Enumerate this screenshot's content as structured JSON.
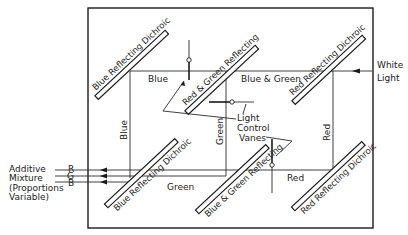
{
  "diagram": {
    "type": "optical-schematic",
    "input": {
      "label_line1": "White",
      "label_line2": "Light"
    },
    "mirrors": [
      {
        "id": "m1",
        "label": "Blue Reflecting Dichroic"
      },
      {
        "id": "m2",
        "label": "Red & Green Reflecting"
      },
      {
        "id": "m3",
        "label": "Red Reflecting Dichroic"
      },
      {
        "id": "m4",
        "label": "Blue Reflecting Dichroic"
      },
      {
        "id": "m5",
        "label": "Blue & Green Reflecting"
      },
      {
        "id": "m6",
        "label": "Red Reflecting Dichroic"
      }
    ],
    "beam_labels": {
      "top_blue": "Blue",
      "top_blue_green": "Blue & Green",
      "vert_blue": "Blue",
      "vert_green": "Green",
      "vert_red": "Red",
      "bottom_green": "Green",
      "bottom_red": "Red"
    },
    "vanes": {
      "line1": "Light",
      "line2": "Control",
      "line3": "Vanes"
    },
    "output": {
      "channels": [
        "R",
        "G",
        "B"
      ],
      "line1": "Additive",
      "line2": "Mixture",
      "line3": "(Proportions",
      "line4": "Variable)"
    }
  }
}
